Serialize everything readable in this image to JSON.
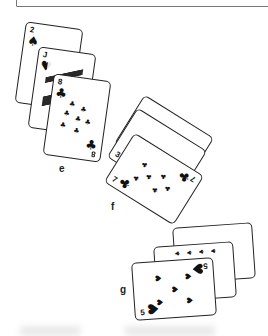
{
  "figure": {
    "groups": [
      {
        "label": "e",
        "cards": [
          {
            "rank": "2",
            "suit": "spades",
            "suit_glyph": "♠"
          },
          {
            "rank": "J",
            "suit": "hearts",
            "suit_glyph": "♥"
          },
          {
            "rank": "8",
            "suit": "clubs",
            "suit_glyph": "♣"
          }
        ]
      },
      {
        "label": "f",
        "cards": [
          {
            "rank": "4",
            "suit": "diamonds",
            "suit_glyph": "♦"
          },
          {
            "rank": "3",
            "suit": "diamonds",
            "suit_glyph": "♦"
          },
          {
            "rank": "7",
            "suit": "clubs",
            "suit_glyph": "♣"
          }
        ]
      },
      {
        "label": "g",
        "cards": [
          {
            "rank": "2",
            "suit": "hearts",
            "suit_glyph": "♥"
          },
          {
            "rank": "10",
            "suit": "clubs",
            "suit_glyph": "♣"
          },
          {
            "rank": "5",
            "suit": "hearts",
            "suit_glyph": "♥"
          }
        ]
      }
    ]
  }
}
